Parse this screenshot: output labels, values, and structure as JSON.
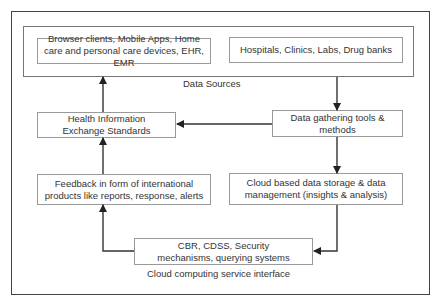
{
  "diagram": {
    "group_label": "Data Sources",
    "interface_label": "Cloud computing service interface",
    "nodes": {
      "browser": "Browser clients, Mobile Apps, Home care and personal care devices, EHR, EMR",
      "hospitals": "Hospitals, Clinics, Labs, Drug banks",
      "hie": "Health Information Exchange Standards",
      "gathering": "Data gathering tools & methods",
      "feedback": "Feedback in form of international products like reports, response, alerts",
      "storage": "Cloud based data storage & data management (insights & analysis)",
      "cbr": "CBR, CDSS, Security mechanisms, querying systems"
    },
    "edges": [
      {
        "from": "hospitals",
        "to": "gathering"
      },
      {
        "from": "gathering",
        "to": "hie"
      },
      {
        "from": "gathering",
        "to": "storage"
      },
      {
        "from": "storage",
        "to": "cbr"
      },
      {
        "from": "cbr",
        "to": "feedback"
      },
      {
        "from": "feedback",
        "to": "hie"
      },
      {
        "from": "hie",
        "to": "data-sources"
      }
    ]
  }
}
